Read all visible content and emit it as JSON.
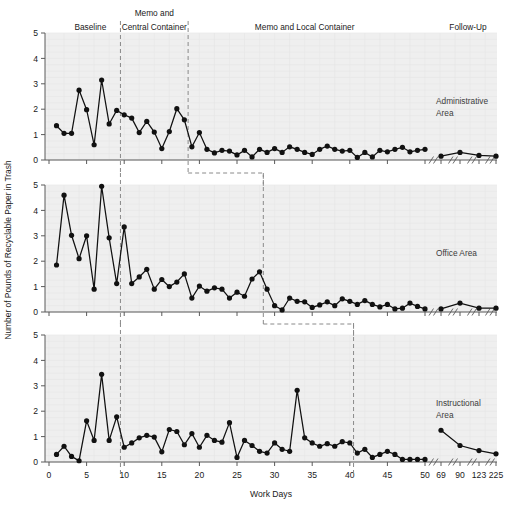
{
  "chart_data": {
    "type": "line",
    "title": "",
    "xlabel": "Work Days",
    "ylabel": "Number of Pounds of Recyclable Paper in Trash",
    "ylim": [
      0,
      5
    ],
    "yticks": [
      0,
      1,
      2,
      3,
      4,
      5
    ],
    "xticks_main": [
      0,
      5,
      10,
      15,
      20,
      25,
      30,
      35,
      40,
      45,
      50
    ],
    "xticks_followup": [
      69,
      90,
      123,
      225
    ],
    "grid": true,
    "legend_position": "none",
    "phase_labels": [
      {
        "text": "Baseline",
        "x_center": 9
      },
      {
        "text": "Memo and",
        "x_center": 22
      },
      {
        "text": "Central Container",
        "x_center": 22
      },
      {
        "text": "Memo and Local Container",
        "x_center": 80
      },
      {
        "text": "Follow-Up",
        "x_center": 160
      }
    ],
    "panels": [
      {
        "name": "Administrative Area",
        "label_line1": "Administrative",
        "label_line2": "Area",
        "phase_change_days": [
          9.5,
          18.5
        ],
        "series": [
          {
            "name": "Administrative Area",
            "x": [
              1,
              2,
              3,
              4,
              5,
              6,
              7,
              8,
              9,
              10,
              11,
              12,
              13,
              14,
              15,
              16,
              17,
              18,
              19,
              20,
              21,
              22,
              23,
              24,
              25,
              26,
              27,
              28,
              29,
              30,
              31,
              32,
              33,
              34,
              35,
              36,
              37,
              38,
              39,
              40,
              41,
              42,
              43,
              44,
              45,
              46,
              47,
              48,
              49,
              50
            ],
            "y": [
              1.35,
              1.05,
              1.05,
              2.75,
              1.98,
              0.6,
              3.15,
              1.42,
              1.95,
              1.78,
              1.65,
              1.08,
              1.52,
              1.1,
              0.45,
              1.12,
              2.02,
              1.58,
              0.52,
              1.08,
              0.42,
              0.28,
              0.38,
              0.35,
              0.2,
              0.38,
              0.12,
              0.42,
              0.3,
              0.45,
              0.3,
              0.52,
              0.42,
              0.3,
              0.22,
              0.42,
              0.55,
              0.42,
              0.35,
              0.38,
              0.1,
              0.3,
              0.12,
              0.38,
              0.32,
              0.42,
              0.5,
              0.32,
              0.38,
              0.42
            ]
          },
          {
            "name": "Administrative Area Follow-Up",
            "x_labels": [
              69,
              90,
              123,
              225
            ],
            "y": [
              0.15,
              0.3,
              0.18,
              0.15
            ]
          }
        ]
      },
      {
        "name": "Office Area",
        "label_line1": "Office Area",
        "label_line2": "",
        "phase_change_days": [
          9.5,
          28.5
        ],
        "series": [
          {
            "name": "Office Area",
            "x": [
              1,
              2,
              3,
              4,
              5,
              6,
              7,
              8,
              9,
              10,
              11,
              12,
              13,
              14,
              15,
              16,
              17,
              18,
              19,
              20,
              21,
              22,
              23,
              24,
              25,
              26,
              27,
              28,
              29,
              30,
              31,
              32,
              33,
              34,
              35,
              36,
              37,
              38,
              39,
              40,
              41,
              42,
              43,
              44,
              45,
              46,
              47,
              48,
              49,
              50
            ],
            "y": [
              1.85,
              4.6,
              3.02,
              2.1,
              3.0,
              0.9,
              4.95,
              2.92,
              1.12,
              3.35,
              1.12,
              1.38,
              1.68,
              0.9,
              1.28,
              1.0,
              1.18,
              1.5,
              0.55,
              1.02,
              0.82,
              0.95,
              0.9,
              0.55,
              0.78,
              0.62,
              1.3,
              1.58,
              0.9,
              0.25,
              0.08,
              0.55,
              0.42,
              0.4,
              0.18,
              0.28,
              0.4,
              0.25,
              0.52,
              0.42,
              0.3,
              0.45,
              0.3,
              0.2,
              0.3,
              0.12,
              0.15,
              0.35,
              0.22,
              0.12
            ]
          },
          {
            "name": "Office Area Follow-Up",
            "x_labels": [
              69,
              90,
              123,
              225
            ],
            "y": [
              0.12,
              0.35,
              0.15,
              0.15
            ]
          }
        ]
      },
      {
        "name": "Instructional Area",
        "label_line1": "Instructional",
        "label_line2": "Area",
        "phase_change_days": [
          9.5,
          40.5
        ],
        "series": [
          {
            "name": "Instructional Area",
            "x": [
              1,
              2,
              3,
              4,
              5,
              6,
              7,
              8,
              9,
              10,
              11,
              12,
              13,
              14,
              15,
              16,
              17,
              18,
              19,
              20,
              21,
              22,
              23,
              24,
              25,
              26,
              27,
              28,
              29,
              30,
              31,
              32,
              33,
              34,
              35,
              36,
              37,
              38,
              39,
              40,
              41,
              42,
              43,
              44,
              45,
              46,
              47,
              48,
              49,
              50
            ],
            "y": [
              0.3,
              0.62,
              0.22,
              0.05,
              1.62,
              0.85,
              3.45,
              0.85,
              1.78,
              0.58,
              0.75,
              0.95,
              1.05,
              0.98,
              0.4,
              1.28,
              1.2,
              0.68,
              1.12,
              0.58,
              1.05,
              0.85,
              0.78,
              1.55,
              0.18,
              0.85,
              0.65,
              0.42,
              0.35,
              0.75,
              0.5,
              0.42,
              2.82,
              0.95,
              0.75,
              0.62,
              0.72,
              0.62,
              0.8,
              0.75,
              0.35,
              0.5,
              0.18,
              0.3,
              0.42,
              0.3,
              0.1,
              0.1,
              0.1,
              0.1
            ]
          },
          {
            "name": "Instructional Area Follow-Up",
            "x_labels": [
              69,
              90,
              123,
              225
            ],
            "y": [
              1.25,
              0.65,
              0.45,
              0.32
            ]
          }
        ]
      }
    ]
  },
  "axis": {
    "x_title": "Work Days",
    "y_title": "Number of Pounds of Recyclable Paper in Trash"
  }
}
